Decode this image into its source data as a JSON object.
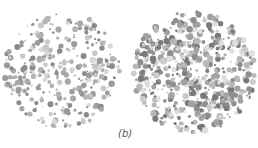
{
  "figure": {
    "caption": "(b)",
    "plates": [
      {
        "name": "plate-left",
        "cx": 62,
        "cy": 70,
        "r": 60,
        "density": "sparse",
        "seed": 7,
        "palette": [
          "#9a9a9a",
          "#b4b4b4",
          "#c8c8c8",
          "#d8d8d8",
          "#8a8a8a",
          "#a8a8a8"
        ],
        "count": 340
      },
      {
        "name": "plate-right",
        "cx": 194,
        "cy": 72,
        "r": 63,
        "density": "dense",
        "seed": 19,
        "palette": [
          "#7a7a7a",
          "#8e8e8e",
          "#a2a2a2",
          "#b8b8b8",
          "#cccccc",
          "#dedede"
        ],
        "count": 620
      }
    ]
  }
}
